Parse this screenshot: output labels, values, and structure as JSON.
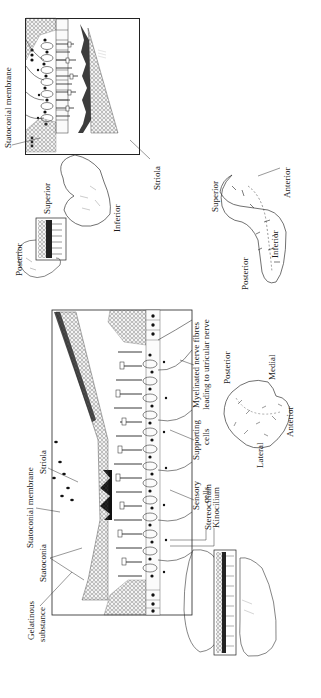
{
  "figure": {
    "orientation": "rotated 90 degrees counter-clockwise"
  },
  "upper_panel": {
    "name": "saccular-macula-section",
    "labels": {
      "statoconial_membrane": "Statoconial membrane",
      "striola": "Striola"
    },
    "inset_outline": {
      "labels": {
        "superior": "Superior",
        "inferior": "Inferior",
        "posterior": "Posterior"
      }
    },
    "orientation_map": {
      "labels": {
        "superior": "Superior",
        "inferior": "Inferior",
        "posterior": "Posterior",
        "anterior": "Anterior"
      }
    }
  },
  "lower_panel": {
    "name": "utricular-macula-section",
    "labels": {
      "gelatinous_substance_line1": "Gelatinous",
      "gelatinous_substance_line2": "substance",
      "statoconia": "Statoconia",
      "statoconial_membrane": "Statoconial membrane",
      "striola": "Striola",
      "sensory_cells_line1": "Sensory",
      "sensory_cells_line2": "cells",
      "stereocilium": "Stereocilium",
      "kinocilium": "Kinocilium",
      "supporting_cells_line1": "Supporting",
      "supporting_cells_line2": "cells",
      "myelinated_line1": "Myelinated nerve fibres",
      "myelinated_line2": "leading to utricular nerve"
    },
    "orientation_map": {
      "labels": {
        "posterior": "Posterior",
        "medial": "Medial",
        "lateral": "Lateral",
        "anterior": "Anterior"
      }
    }
  }
}
